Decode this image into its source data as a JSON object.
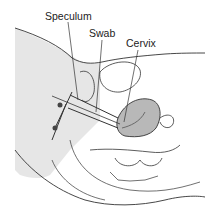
{
  "diagram": {
    "type": "anatomical-illustration",
    "labels": [
      {
        "id": "speculum",
        "text": "Speculum",
        "x": 45,
        "y": 11
      },
      {
        "id": "swab",
        "text": "Swab",
        "x": 89,
        "y": 28
      },
      {
        "id": "cervix",
        "text": "Cervix",
        "x": 126,
        "y": 38
      }
    ],
    "colors": {
      "line": "#333333",
      "shade": "#e4e4e4",
      "tissue_fill": "#b8b8b8",
      "background": "#ffffff"
    }
  }
}
